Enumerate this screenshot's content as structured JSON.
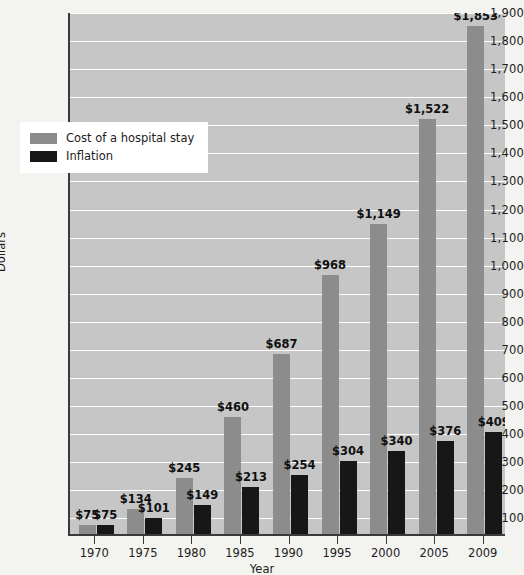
{
  "chart_data": {
    "type": "bar",
    "title": "",
    "xlabel": "Year",
    "ylabel": "Dollars",
    "categories": [
      "1970",
      "1975",
      "1980",
      "1985",
      "1990",
      "1995",
      "2000",
      "2005",
      "2009"
    ],
    "series": [
      {
        "name": "Cost of a hospital stay",
        "color": "#8c8c8c",
        "values": [
          75,
          134,
          245,
          460,
          687,
          968,
          1149,
          1522,
          1853
        ],
        "labels": [
          "$75",
          "$134",
          "$245",
          "$460",
          "$687",
          "$968",
          "$1,149",
          "$1,522",
          "$1,853"
        ]
      },
      {
        "name": "Inflation",
        "color": "#171717",
        "values": [
          75,
          101,
          149,
          213,
          254,
          304,
          340,
          376,
          409
        ],
        "labels": [
          "$75",
          "$101",
          "$149",
          "$213",
          "$254",
          "$304",
          "$340",
          "$376",
          "$409"
        ]
      }
    ],
    "ylim": [
      41,
      1900
    ],
    "ytick_values": [
      100,
      200,
      300,
      400,
      500,
      600,
      700,
      800,
      900,
      1000,
      1100,
      1200,
      1300,
      1400,
      1500,
      1600,
      1700,
      1800,
      1900
    ],
    "ytick_labels": [
      "100",
      "200",
      "300",
      "400",
      "500",
      "600",
      "700",
      "800",
      "900",
      "1,000",
      "1,100",
      "1,200",
      "1,300",
      "1,400",
      "1,500",
      "1,600",
      "1,700",
      "1,800",
      "1,900"
    ],
    "grid": true,
    "legend_position": "upper-left-inset",
    "plot_background": "#c6c6c6",
    "gridline_color": "#ffffff",
    "axis_color": "#3a3a3a"
  },
  "legend": {
    "entries": [
      {
        "label": "Cost of a hospital stay",
        "swatch": "cost"
      },
      {
        "label": "Inflation",
        "swatch": "infl"
      }
    ]
  }
}
